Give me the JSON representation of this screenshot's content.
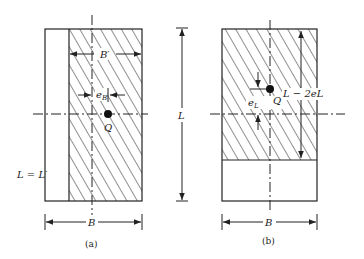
{
  "figure": {
    "panel_a": {
      "caption": "(a)",
      "labels": {
        "effective_width": "B′",
        "eccentricity": "e",
        "eccentricity_sub": "B",
        "load_point": "Q",
        "length_relation": "L = L′",
        "width": "B"
      }
    },
    "panel_b": {
      "caption": "(b)",
      "labels": {
        "eccentricity": "e",
        "eccentricity_sub": "L",
        "load_point": "Q",
        "effective_length": "L − 2eL",
        "width": "B"
      }
    },
    "shared": {
      "length_label": "L"
    },
    "colors": {
      "line": "#222222",
      "background": "#ffffff"
    }
  }
}
